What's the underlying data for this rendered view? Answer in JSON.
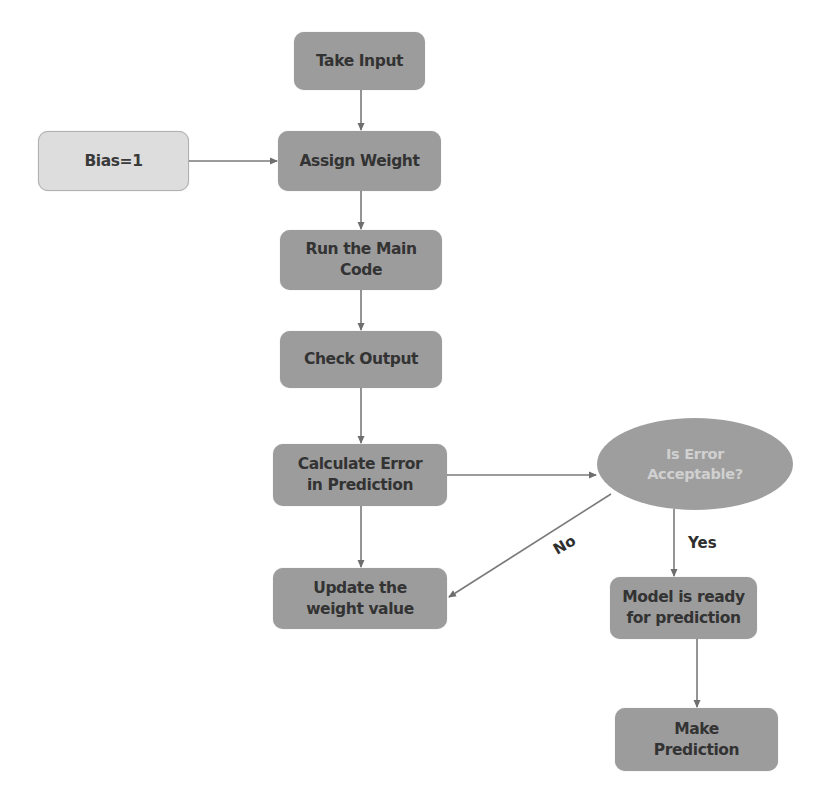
{
  "diagram": {
    "type": "flowchart",
    "colors": {
      "process_fill": "#9c9c9c",
      "input_fill": "#dddddd",
      "decision_fill": "#9e9e9e",
      "decision_text": "#d0d0d0",
      "text": "#333333",
      "edge": "#7a7a7a"
    },
    "nodes": {
      "take_input": {
        "label": "Take Input"
      },
      "bias": {
        "label": "Bias=1"
      },
      "assign_weight": {
        "label": "Assign Weight"
      },
      "run_main_code": {
        "label_line1": "Run the Main",
        "label_line2": "Code"
      },
      "check_output": {
        "label": "Check Output"
      },
      "calculate_error": {
        "label_line1": "Calculate Error",
        "label_line2": "in Prediction"
      },
      "is_error_acceptable": {
        "label_line1": "Is Error",
        "label_line2": "Acceptable?"
      },
      "update_weight": {
        "label_line1": "Update the",
        "label_line2": "weight value"
      },
      "model_ready": {
        "label_line1": "Model is ready",
        "label_line2": "for prediction"
      },
      "make_prediction": {
        "label_line1": "Make",
        "label_line2": "Prediction"
      }
    },
    "edges": [
      {
        "from": "take_input",
        "to": "assign_weight",
        "label": ""
      },
      {
        "from": "bias",
        "to": "assign_weight",
        "label": ""
      },
      {
        "from": "assign_weight",
        "to": "run_main_code",
        "label": ""
      },
      {
        "from": "run_main_code",
        "to": "check_output",
        "label": ""
      },
      {
        "from": "check_output",
        "to": "calculate_error",
        "label": ""
      },
      {
        "from": "calculate_error",
        "to": "is_error_acceptable",
        "label": ""
      },
      {
        "from": "calculate_error",
        "to": "update_weight",
        "label": ""
      },
      {
        "from": "is_error_acceptable",
        "to": "update_weight",
        "label": "No"
      },
      {
        "from": "is_error_acceptable",
        "to": "model_ready",
        "label": "Yes"
      },
      {
        "from": "model_ready",
        "to": "make_prediction",
        "label": ""
      }
    ],
    "edge_labels": {
      "no": "No",
      "yes": "Yes"
    }
  }
}
